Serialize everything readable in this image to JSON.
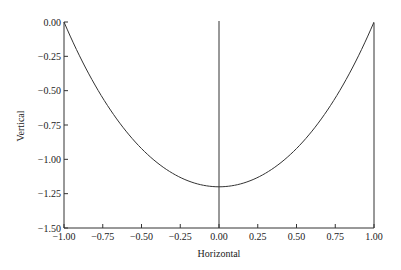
{
  "chart_data": {
    "type": "line",
    "title": "",
    "xlabel": "Horizontal",
    "ylabel": "Vertical",
    "xlim": [
      -1.0,
      1.0
    ],
    "ylim": [
      -1.5,
      0.0
    ],
    "x_ticks": [
      "-1.00",
      "-0.75",
      "-0.50",
      "-0.25",
      "0.00",
      "0.25",
      "0.50",
      "0.75",
      "1.00"
    ],
    "y_ticks": [
      "0.00",
      "-0.25",
      "-0.50",
      "-0.75",
      "-1.00",
      "-1.25",
      "-1.50"
    ],
    "grid": false,
    "legend": null,
    "annotations": [
      "vertical line at x = 0.00",
      "vertical line at x = 1.00"
    ],
    "series": [
      {
        "name": "curve",
        "x": [
          -1.0,
          -0.75,
          -0.5,
          -0.25,
          0.0,
          0.25,
          0.5,
          0.75,
          1.0
        ],
        "values": [
          0.0,
          -0.53,
          -0.9,
          -1.13,
          -1.2,
          -1.13,
          -0.9,
          -0.53,
          0.0
        ]
      }
    ]
  }
}
